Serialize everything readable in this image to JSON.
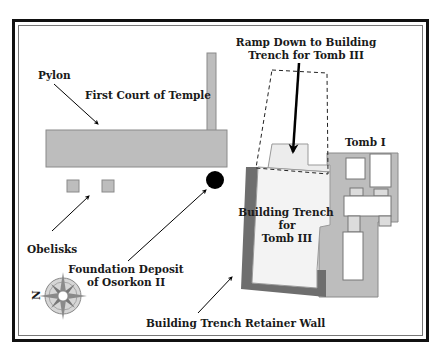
{
  "diagram": {
    "type": "site-plan",
    "colors": {
      "frame": "#111111",
      "structure_fill": "#bdbdbd",
      "structure_stroke": "#8a8a8a",
      "trench_fill": "#f3f3f3",
      "retainer_wall": "#6e6e6e",
      "ramp_block": "#ececec",
      "deposit": "#000000",
      "background": "#ffffff"
    },
    "labels": {
      "pylon": "Pylon",
      "first_court": "First Court of Temple",
      "ramp_line1": "Ramp Down to Building",
      "ramp_line2": "Trench for Tomb III",
      "tomb1": "Tomb I",
      "trench_line1": "Building Trench",
      "trench_line2": "for",
      "trench_line3": "Tomb III",
      "obelisks": "Obelisks",
      "deposit_line1": "Foundation Deposit",
      "deposit_line2": "of Osorkon II",
      "retainer_wall": "Building Trench Retainer Wall",
      "compass_north": "N"
    }
  }
}
